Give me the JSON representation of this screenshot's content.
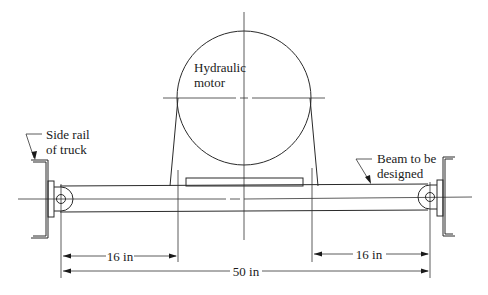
{
  "diagram": {
    "labels": {
      "motor_line1": "Hydraulic",
      "motor_line2": "motor",
      "side_rail_line1": "Side rail",
      "side_rail_line2": "of truck",
      "beam_line1": "Beam to be",
      "beam_line2": "designed"
    },
    "dimensions": {
      "left_span": "16 in",
      "right_span": "16 in",
      "total_span": "50 in"
    },
    "colors": {
      "line": "#2a2a2a",
      "background": "#ffffff"
    }
  }
}
